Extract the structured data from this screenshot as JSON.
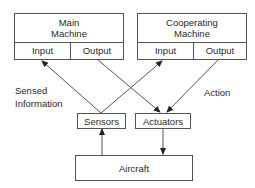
{
  "diagram": {
    "main_machine": {
      "title_line1": "Main",
      "title_line2": "Machine",
      "input_label": "Input",
      "output_label": "Output"
    },
    "cooperating_machine": {
      "title_line1": "Cooperating",
      "title_line2": "Machine",
      "input_label": "Input",
      "output_label": "Output"
    },
    "sensors": {
      "label": "Sensors"
    },
    "actuators": {
      "label": "Actuators"
    },
    "aircraft": {
      "label": "Aircraft"
    },
    "annotations": {
      "sensed_line1": "Sensed",
      "sensed_line2": "Information",
      "action": "Action"
    },
    "edges": [
      {
        "from": "sensors",
        "to": "main_machine.input"
      },
      {
        "from": "sensors",
        "to": "cooperating_machine.input"
      },
      {
        "from": "main_machine.output",
        "to": "actuators"
      },
      {
        "from": "cooperating_machine.output",
        "to": "actuators"
      },
      {
        "from": "aircraft",
        "to": "sensors"
      },
      {
        "from": "actuators",
        "to": "aircraft"
      }
    ],
    "colors": {
      "line": "#555555",
      "text": "#2a2a2a",
      "background": "#ffffff"
    }
  }
}
